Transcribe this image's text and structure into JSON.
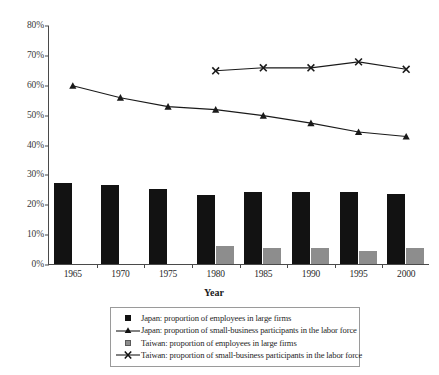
{
  "chart_data": {
    "type": "bar",
    "title": "",
    "xlabel": "Year",
    "ylabel": "",
    "categories": [
      "1965",
      "1970",
      "1975",
      "1980",
      "1985",
      "1990",
      "1995",
      "2000"
    ],
    "ylim": [
      0,
      80
    ],
    "ytick_labels": [
      "0%",
      "10%",
      "20%",
      "30%",
      "40%",
      "50%",
      "60%",
      "70%",
      "80%"
    ],
    "ytick_values": [
      0,
      10,
      20,
      30,
      40,
      50,
      60,
      70,
      80
    ],
    "grid": false,
    "legend_position": "bottom",
    "series": [
      {
        "name": "Japan: proportion of employees in large firms",
        "kind": "bar",
        "marker": "filled-square",
        "color": "#121212",
        "values": [
          27,
          26.5,
          25,
          23,
          24,
          24,
          24,
          23.5
        ]
      },
      {
        "name": "Japan: proportion of small-business participants in the labor force",
        "kind": "line",
        "marker": "triangle",
        "color": "#1a1a1a",
        "values": [
          60,
          56,
          53,
          52,
          50,
          47.5,
          44.5,
          43
        ]
      },
      {
        "name": "Taiwan: proportion of employees in large firms",
        "kind": "bar",
        "marker": "gray-square",
        "color": "#8d8d8d",
        "values": [
          null,
          null,
          null,
          6,
          5.5,
          5.5,
          4.5,
          5.5
        ]
      },
      {
        "name": "Taiwan: proportion of small-business participants in the labor force",
        "kind": "line",
        "marker": "x",
        "color": "#1a1a1a",
        "values": [
          null,
          null,
          null,
          65,
          66,
          66,
          68,
          65.5
        ]
      }
    ]
  },
  "legend": {
    "items": [
      "Japan: proportion of employees in large firms",
      "Japan: proportion of small-business participants in the labor force",
      "Taiwan: proportion of employees in large firms",
      "Taiwan: proportion of small-business participants in the labor force"
    ]
  }
}
